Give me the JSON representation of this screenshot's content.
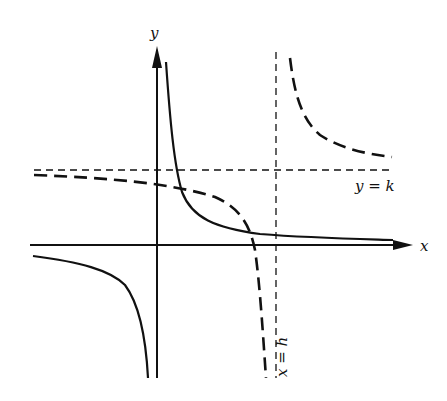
{
  "figure": {
    "type": "graph of rational functions with asymptotes",
    "colors": {
      "ink": "#111111",
      "background": "#ffffff"
    },
    "axes": {
      "x_label": "x",
      "y_label": "y",
      "origin_px": [
        157,
        245
      ]
    },
    "asymptotes": {
      "horizontal": {
        "label": "y = k",
        "y_px": 170,
        "style": "short-dash"
      },
      "vertical": {
        "label": "x = h",
        "x_px": 276,
        "style": "short-dash"
      }
    },
    "curves": [
      {
        "name": "solid-hyperbola",
        "style": "solid",
        "description": "y = a/x type curve with asymptotes at the coordinate axes"
      },
      {
        "name": "dashed-hyperbola",
        "style": "long-dash",
        "description": "translated hyperbola with asymptotes x = h and y = k"
      }
    ]
  }
}
